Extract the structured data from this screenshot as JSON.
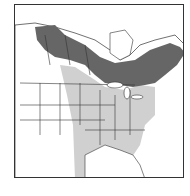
{
  "map": {
    "title": "",
    "region": "North America",
    "colors": {
      "breeding_range": "#666666",
      "winter_range": "#d0d0d0",
      "background": "#ffffff",
      "borders": "#333333"
    },
    "legend": []
  }
}
